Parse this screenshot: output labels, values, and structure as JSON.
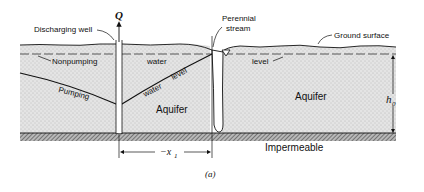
{
  "figure": {
    "caption": "(a)",
    "labels": {
      "flow": "Q",
      "discharging_well": "Discharging well",
      "perennial_stream_line1": "Perennial",
      "perennial_stream_line2": "stream",
      "ground_surface": "Ground surface",
      "nonpumping": "Nonpumping",
      "water_top": "water",
      "level_right": "level",
      "pumping": "Pumping",
      "water_slope": "water",
      "level_slope": "level",
      "aquifer_left": "Aquifer",
      "aquifer_right": "Aquifer",
      "impermeable": "Impermeable",
      "h0_main": "h",
      "h0_sub": "0",
      "x1_prefix": "−x",
      "x1_sub": "1"
    },
    "colors": {
      "aquifer_fill": "#e2e2e2",
      "line": "#111111",
      "impermeable_fill": "#8a8a8a",
      "background": "#ffffff"
    }
  }
}
